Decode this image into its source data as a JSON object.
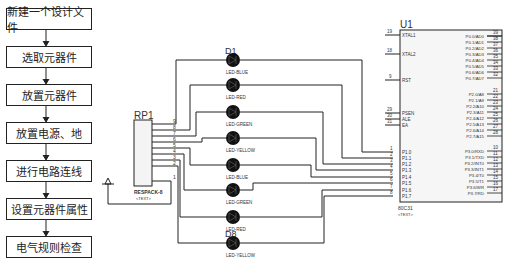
{
  "flowchart": {
    "steps": [
      {
        "label": "新建一个设计文件"
      },
      {
        "label": "选取元器件"
      },
      {
        "label": "放置元器件"
      },
      {
        "label": "放置电源、地"
      },
      {
        "label": "进行电路连线"
      },
      {
        "label": "设置元器件属性"
      },
      {
        "label": "电气规则检查"
      }
    ]
  },
  "schematic": {
    "resistor_pack": {
      "ref": "RP1",
      "value": "RESPACK-8",
      "text": "<TEXT>",
      "pins": [
        "9",
        "8",
        "7",
        "6",
        "5",
        "4",
        "3",
        "2",
        "1"
      ]
    },
    "leds": [
      {
        "ref": "D1",
        "value": "LED-BLUE"
      },
      {
        "ref": "D2",
        "value": "LED-RED"
      },
      {
        "ref": "D3",
        "value": "LED-GREEN"
      },
      {
        "ref": "D4",
        "value": "LED-YELLOW"
      },
      {
        "ref": "D5",
        "value": "LED-BLUE"
      },
      {
        "ref": "D6",
        "value": "LED-GREEN"
      },
      {
        "ref": "D7",
        "value": "LED-RED"
      },
      {
        "ref": "D8",
        "value": "LED-YELLOW"
      }
    ],
    "mcu": {
      "ref": "U1",
      "value": "80C31",
      "text": "<TEXT>",
      "left_pins": [
        {
          "num": "19",
          "name": "XTAL1"
        },
        {
          "num": "18",
          "name": "XTAL2"
        },
        {
          "num": "9",
          "name": "RST"
        },
        {
          "num": "29",
          "name": "PSEN"
        },
        {
          "num": "30",
          "name": "ALE"
        },
        {
          "num": "31",
          "name": "EA"
        },
        {
          "num": "1",
          "name": "P1.0"
        },
        {
          "num": "2",
          "name": "P1.1"
        },
        {
          "num": "3",
          "name": "P1.2"
        },
        {
          "num": "4",
          "name": "P1.3"
        },
        {
          "num": "5",
          "name": "P1.4"
        },
        {
          "num": "6",
          "name": "P1.5"
        },
        {
          "num": "7",
          "name": "P1.6"
        },
        {
          "num": "8",
          "name": "P1.7"
        }
      ],
      "right_pins": [
        {
          "num": "39",
          "name": "P0.0/AD0"
        },
        {
          "num": "38",
          "name": "P0.1/AD1"
        },
        {
          "num": "37",
          "name": "P0.2/AD2"
        },
        {
          "num": "36",
          "name": "P0.3/AD3"
        },
        {
          "num": "35",
          "name": "P0.4/AD4"
        },
        {
          "num": "34",
          "name": "P0.5/AD5"
        },
        {
          "num": "33",
          "name": "P0.6/AD6"
        },
        {
          "num": "32",
          "name": "P0.7/AD7"
        },
        {
          "num": "21",
          "name": "P2.0/A8"
        },
        {
          "num": "22",
          "name": "P2.1/A9"
        },
        {
          "num": "23",
          "name": "P2.2/A10"
        },
        {
          "num": "24",
          "name": "P2.3/A11"
        },
        {
          "num": "25",
          "name": "P2.4/A12"
        },
        {
          "num": "26",
          "name": "P2.5/A13"
        },
        {
          "num": "27",
          "name": "P2.6/A14"
        },
        {
          "num": "28",
          "name": "P2.7/A15"
        },
        {
          "num": "10",
          "name": "P3.0/RXD"
        },
        {
          "num": "11",
          "name": "P3.1/TXD"
        },
        {
          "num": "12",
          "name": "P3.2/INT0"
        },
        {
          "num": "13",
          "name": "P3.3/INT1"
        },
        {
          "num": "14",
          "name": "P3.4/T0"
        },
        {
          "num": "15",
          "name": "P3.5/T1"
        },
        {
          "num": "16",
          "name": "P3.6/WR"
        },
        {
          "num": "17",
          "name": "P3.7/RD"
        }
      ]
    }
  }
}
